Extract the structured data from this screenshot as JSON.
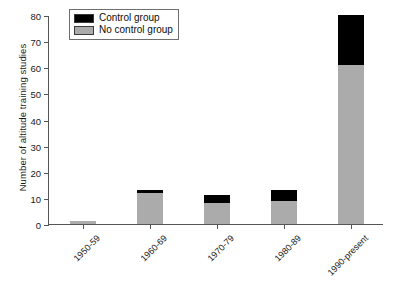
{
  "chart_data": {
    "type": "bar",
    "stacked": true,
    "title": "",
    "xlabel": "",
    "ylabel": "Number of altitude training studies",
    "categories": [
      "1950-59",
      "1960-69",
      "1970-79",
      "1980-89",
      "1990-present"
    ],
    "series": [
      {
        "name": "No control group",
        "color": "#ababab",
        "values": [
          1,
          12,
          8,
          9,
          61
        ]
      },
      {
        "name": "Control group",
        "color": "#000000",
        "values": [
          0,
          1,
          3,
          4,
          19
        ]
      }
    ],
    "totals": [
      1,
      13,
      11,
      13,
      80
    ],
    "ylim": [
      0,
      80
    ],
    "ytick_labels": [
      "0",
      "10",
      "20",
      "30",
      "40",
      "50",
      "60",
      "70",
      "80"
    ],
    "ytick_values": [
      0,
      10,
      20,
      30,
      40,
      50,
      60,
      70,
      80
    ],
    "grid": false,
    "legend_position": "top-left",
    "legend_entries": [
      {
        "label": "Control group",
        "color": "#000000"
      },
      {
        "label": "No control group",
        "color": "#ababab"
      }
    ]
  },
  "axis_color": "#555555",
  "text_color": "#1a1a1a"
}
